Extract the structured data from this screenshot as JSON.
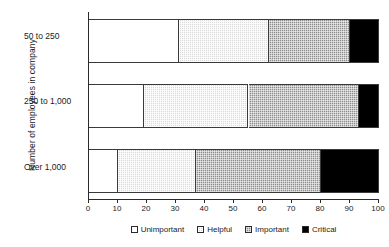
{
  "chart_data": {
    "type": "bar",
    "orientation": "horizontal",
    "stacked": true,
    "stack_total": 100,
    "title": "",
    "xlabel": "",
    "ylabel": "Number of employees in company",
    "xlim": [
      0,
      100
    ],
    "xticks": [
      0,
      10,
      20,
      30,
      40,
      50,
      60,
      70,
      80,
      90,
      100
    ],
    "xtick_labels": [
      "0",
      "10",
      "20",
      "30",
      "40",
      "50",
      "60",
      "70",
      "80",
      "90",
      "100"
    ],
    "grid": false,
    "legend_position": "bottom",
    "categories": [
      "50 to 250",
      "250 to 1,000",
      "Over 1,000"
    ],
    "series": [
      {
        "name": "Unimportant",
        "color": "#ffffff",
        "values": [
          31,
          19,
          10
        ]
      },
      {
        "name": "Helpful",
        "color": "#d9d9d9",
        "values": [
          31,
          36,
          27
        ]
      },
      {
        "name": "Important",
        "color": "#8d8d8d",
        "values": [
          28,
          38,
          43
        ]
      },
      {
        "name": "Critical",
        "color": "#000000",
        "values": [
          10,
          7,
          20
        ]
      }
    ],
    "cumulative_boundaries": [
      [
        31,
        62,
        90,
        100
      ],
      [
        19,
        55,
        93,
        100
      ],
      [
        10,
        37,
        80,
        100
      ]
    ]
  },
  "axis": {
    "y_title": "Number of employees in company",
    "category_labels": [
      "50 to 250",
      "250 to 1,000",
      "Over 1,000"
    ],
    "x_tick_labels": [
      "0",
      "10",
      "20",
      "30",
      "40",
      "50",
      "60",
      "70",
      "80",
      "90",
      "100"
    ]
  },
  "legend": {
    "items": [
      {
        "label": "Unimportant",
        "swatch": "unimportant-swatch"
      },
      {
        "label": "Helpful",
        "swatch": "helpful-swatch"
      },
      {
        "label": "Important",
        "swatch": "important-swatch"
      },
      {
        "label": "Critical",
        "swatch": "critical-swatch"
      }
    ]
  }
}
